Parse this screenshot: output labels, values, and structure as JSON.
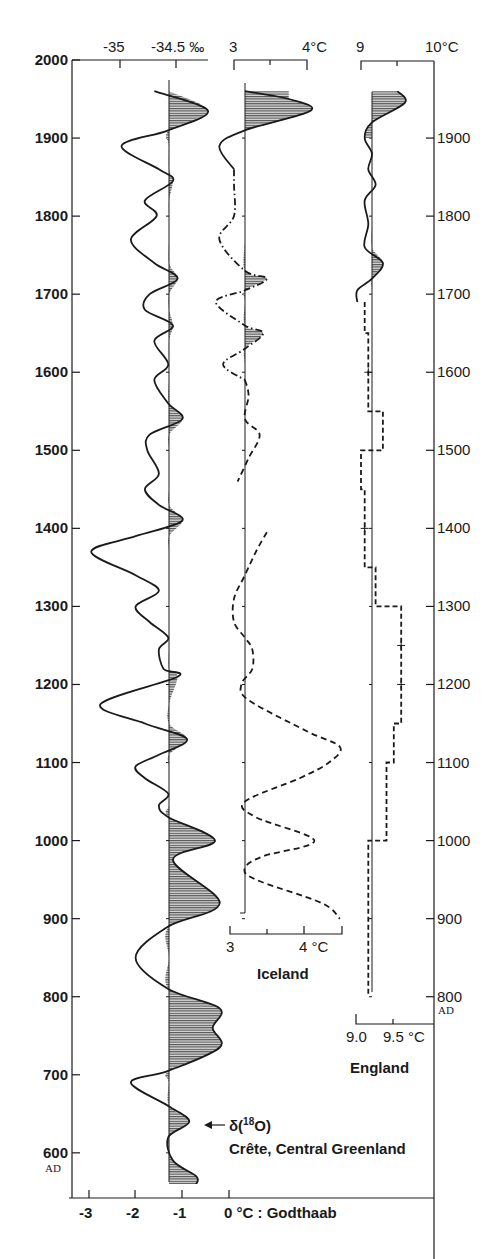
{
  "chart_data": {
    "type": "line",
    "title": "",
    "y_axis": {
      "label_left": "AD",
      "label_right": "AD",
      "ticks": [
        2000,
        1900,
        1800,
        1700,
        1600,
        1500,
        1400,
        1300,
        1200,
        1100,
        1000,
        900,
        800,
        700,
        600
      ],
      "range": [
        550,
        2000
      ]
    },
    "series": [
      {
        "name": "Greenland",
        "label": "δ(18O) Crête, Central Greenland",
        "label_line1_prefix": "δ(",
        "label_line1_sup": "18",
        "label_line1_suffix": "O)",
        "label_line2": "Crête, Central Greenland",
        "style": "solid",
        "top_axis": {
          "ticks": [
            "-35",
            "-34.5 ‰"
          ]
        },
        "bottom_axis": {
          "ticks": [
            "-3",
            "-2",
            "-1",
            "0 °C : Godthaab"
          ],
          "values": [
            -3,
            -2,
            -1,
            0
          ]
        },
        "reference_value_c": -1.3,
        "values_c": [
          [
            1960,
            -1.6
          ],
          [
            1935,
            -0.45
          ],
          [
            1910,
            -1.3
          ],
          [
            1890,
            -2.3
          ],
          [
            1860,
            -1.5
          ],
          [
            1845,
            -1.2
          ],
          [
            1820,
            -1.8
          ],
          [
            1800,
            -1.55
          ],
          [
            1770,
            -2.1
          ],
          [
            1740,
            -1.6
          ],
          [
            1720,
            -1.1
          ],
          [
            1700,
            -1.7
          ],
          [
            1680,
            -1.8
          ],
          [
            1660,
            -1.2
          ],
          [
            1640,
            -1.6
          ],
          [
            1610,
            -1.3
          ],
          [
            1590,
            -1.6
          ],
          [
            1560,
            -1.3
          ],
          [
            1540,
            -1.0
          ],
          [
            1520,
            -1.7
          ],
          [
            1500,
            -1.75
          ],
          [
            1470,
            -1.5
          ],
          [
            1450,
            -1.8
          ],
          [
            1430,
            -1.5
          ],
          [
            1410,
            -1.0
          ],
          [
            1390,
            -2.0
          ],
          [
            1370,
            -2.95
          ],
          [
            1340,
            -2.0
          ],
          [
            1320,
            -1.5
          ],
          [
            1300,
            -2.0
          ],
          [
            1280,
            -1.7
          ],
          [
            1260,
            -1.3
          ],
          [
            1245,
            -1.5
          ],
          [
            1220,
            -1.4
          ],
          [
            1210,
            -1.1
          ],
          [
            1175,
            -2.75
          ],
          [
            1150,
            -1.8
          ],
          [
            1130,
            -0.9
          ],
          [
            1110,
            -1.5
          ],
          [
            1095,
            -2.0
          ],
          [
            1080,
            -1.8
          ],
          [
            1060,
            -1.3
          ],
          [
            1045,
            -1.5
          ],
          [
            1030,
            -1.3
          ],
          [
            1000,
            -0.3
          ],
          [
            975,
            -1.2
          ],
          [
            920,
            -0.2
          ],
          [
            890,
            -1.3
          ],
          [
            850,
            -2.0
          ],
          [
            810,
            -1.3
          ],
          [
            785,
            -0.2
          ],
          [
            760,
            -0.35
          ],
          [
            735,
            -0.2
          ],
          [
            705,
            -1.3
          ],
          [
            690,
            -2.1
          ],
          [
            660,
            -1.3
          ],
          [
            640,
            -0.85
          ],
          [
            620,
            -1.3
          ],
          [
            590,
            -1.2
          ],
          [
            570,
            -0.7
          ],
          [
            560,
            -0.7
          ]
        ]
      },
      {
        "name": "Iceland",
        "label": "Iceland",
        "style": "dash-dot / dashed",
        "top_axis": {
          "ticks": [
            "3",
            "4°C"
          ]
        },
        "bottom_axis": {
          "ticks": [
            "3",
            "4 °C"
          ],
          "values": [
            3,
            4
          ]
        },
        "reference_value_c": 3.15,
        "values_c": [
          [
            1960,
            3.15
          ],
          [
            1950,
            3.75
          ],
          [
            1935,
            4.05
          ],
          [
            1910,
            3.15
          ],
          [
            1890,
            2.8
          ],
          [
            1860,
            3.0
          ],
          [
            1840,
            3.0
          ],
          [
            1800,
            3.0
          ],
          [
            1770,
            2.8
          ],
          [
            1730,
            3.15
          ],
          [
            1720,
            3.45
          ],
          [
            1705,
            3.15
          ],
          [
            1690,
            2.75
          ],
          [
            1660,
            3.15
          ],
          [
            1650,
            3.4
          ],
          [
            1630,
            3.15
          ],
          [
            1610,
            2.85
          ],
          [
            1590,
            3.15
          ],
          [
            1570,
            3.2
          ],
          [
            1540,
            3.15
          ],
          [
            1520,
            3.35
          ],
          [
            1490,
            3.2
          ],
          [
            1460,
            3.05
          ]
        ],
        "values_c_early": [
          [
            1395,
            3.45
          ],
          [
            1370,
            3.3
          ],
          [
            1340,
            3.15
          ],
          [
            1310,
            3.0
          ],
          [
            1280,
            3.0
          ],
          [
            1260,
            3.15
          ],
          [
            1245,
            3.25
          ],
          [
            1220,
            3.25
          ],
          [
            1200,
            3.1
          ],
          [
            1180,
            3.2
          ],
          [
            1140,
            4.0
          ],
          [
            1120,
            4.45
          ],
          [
            1100,
            4.3
          ],
          [
            1080,
            3.9
          ],
          [
            1050,
            3.15
          ],
          [
            1030,
            3.3
          ],
          [
            1000,
            4.1
          ],
          [
            980,
            3.4
          ],
          [
            965,
            3.15
          ],
          [
            950,
            3.3
          ],
          [
            920,
            4.2
          ],
          [
            900,
            4.45
          ]
        ]
      },
      {
        "name": "England",
        "label": "England",
        "style": "solid (modern) / dashed step (reconstructed)",
        "top_axis": {
          "ticks": [
            "9",
            "10°C"
          ]
        },
        "bottom_axis": {
          "ticks": [
            "9.0",
            "9.5 °C"
          ],
          "values": [
            9.0,
            9.5
          ]
        },
        "reference_value_c": 9.15,
        "values_c": [
          [
            1960,
            9.5
          ],
          [
            1945,
            9.6
          ],
          [
            1920,
            9.15
          ],
          [
            1900,
            9.05
          ],
          [
            1880,
            9.15
          ],
          [
            1860,
            9.1
          ],
          [
            1840,
            9.2
          ],
          [
            1820,
            9.05
          ],
          [
            1790,
            9.1
          ],
          [
            1760,
            9.05
          ],
          [
            1740,
            9.3
          ],
          [
            1720,
            9.15
          ],
          [
            1705,
            8.95
          ],
          [
            1690,
            8.95
          ]
        ],
        "steps_c": [
          [
            1690,
            1650,
            9.05
          ],
          [
            1650,
            1550,
            9.1
          ],
          [
            1550,
            1500,
            9.3
          ],
          [
            1500,
            1450,
            9.0
          ],
          [
            1450,
            1350,
            9.05
          ],
          [
            1350,
            1300,
            9.2
          ],
          [
            1300,
            1150,
            9.55
          ],
          [
            1150,
            1100,
            9.45
          ],
          [
            1100,
            1000,
            9.35
          ],
          [
            1000,
            800,
            9.1
          ]
        ],
        "markers": [
          1600,
          1400,
          1250,
          1200
        ]
      }
    ]
  },
  "labels": {
    "greenland_top_neg35": "-35",
    "greenland_top_neg345": "-34.5 ‰",
    "iceland_top_3": "3",
    "iceland_top_4": "4°C",
    "england_top_9": "9",
    "england_top_10": "10°C",
    "iceland_bottom_3": "3",
    "iceland_bottom_4": "4 °C",
    "iceland_name": "Iceland",
    "england_bottom_9": "9.0",
    "england_bottom_95": "9.5 °C",
    "england_name": "England",
    "greenland_bottom_neg3": "-3",
    "greenland_bottom_neg2": "-2",
    "greenland_bottom_neg1": "-1",
    "greenland_bottom_0": "0 °C :  Godthaab",
    "delta_prefix": "δ(",
    "delta_sup": "18",
    "delta_suffix": "O)",
    "greenland_location": "Crête, Central Greenland",
    "ad_left": "AD",
    "ad_right": "AD",
    "arrow": "←"
  }
}
